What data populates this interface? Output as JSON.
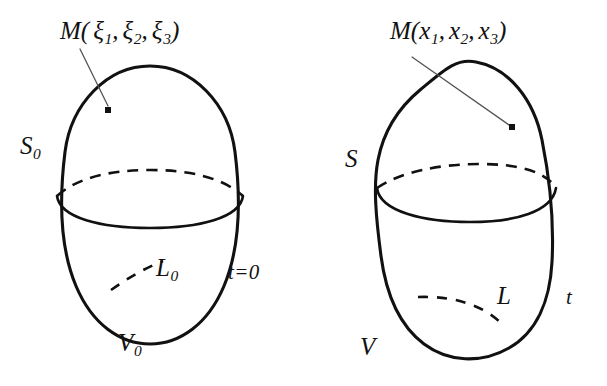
{
  "figure": {
    "background_color": "#ffffff",
    "ink_color": "#111111",
    "leader_color": "#555555",
    "width": 607,
    "height": 386
  },
  "panels": [
    {
      "id": "reference-configuration",
      "side": "left",
      "point_label": {
        "name": "M",
        "open_paren": "(",
        "coordinates": [
          "ξ",
          "ξ",
          "ξ"
        ],
        "subscripts": [
          "1",
          "2",
          "3"
        ],
        "separator": ",",
        "close_paren": ")",
        "full_text": "M(ξ₁, ξ₂, ξ₃)"
      },
      "surface_label": {
        "symbol": "S",
        "subscript": "0",
        "full_text": "S₀"
      },
      "curve_label": {
        "symbol": "L",
        "subscript": "0",
        "full_text": "L₀"
      },
      "volume_label": {
        "symbol": "V",
        "subscript": "0",
        "full_text": "V₀"
      },
      "time_label": {
        "symbol": "t",
        "relation": "=",
        "value": "0",
        "full_text": "t=0"
      }
    },
    {
      "id": "current-configuration",
      "side": "right",
      "point_label": {
        "name": "M",
        "open_paren": "(",
        "coordinates": [
          "x",
          "x",
          "x"
        ],
        "subscripts": [
          "1",
          "2",
          "3"
        ],
        "separator": ",",
        "close_paren": ")",
        "full_text": "M(x₁, x₂, x₃)"
      },
      "surface_label": {
        "symbol": "S",
        "subscript": "",
        "full_text": "S"
      },
      "curve_label": {
        "symbol": "L",
        "subscript": "",
        "full_text": "L"
      },
      "volume_label": {
        "symbol": "V",
        "subscript": "",
        "full_text": "V"
      },
      "time_label": {
        "symbol": "t",
        "relation": "",
        "value": "",
        "full_text": "t"
      }
    }
  ],
  "geometry": {
    "left_body_path": "M 150 66 C 193 66 229 104 235 152 C 241 200 240 248 224 286 C 208 324 180 344 150 344 C 120 344 92 324 76 286 C 60 248 59 200 65 152 C 71 104 107 66 150 66 Z",
    "left_equator_back": "M 57 196 C 78 177 112 170 150 170 C 188 170 222 177 243 196",
    "left_equator_front": "M 57 196 C 60 218 101 228 150 228 C 199 228 240 218 243 196",
    "left_interior_curve": "M 111 290 C 128 278 145 268 163 261",
    "left_leader": "M 80 49 L 108 106",
    "left_point": {
      "x": 108,
      "y": 110,
      "size": 6
    },
    "right_body_path": "M 476 62 C 509 68 534 100 542 140 C 550 180 554 224 552 262 C 550 300 537 332 509 348 C 481 364 448 362 424 344 C 400 326 386 294 381 256 C 376 218 373 186 378 160 C 383 134 396 110 420 90 C 444 70 456 58 476 62 Z",
    "right_equator_back": "M 377 188 C 400 172 440 164 480 164 C 520 164 546 172 556 188",
    "right_equator_front": "M 377 188 C 380 212 425 222 470 222 C 515 222 552 212 556 188",
    "right_interior_curve": "M 418 297 C 448 296 478 302 500 322",
    "right_leader": "M 412 57 L 512 127",
    "right_point": {
      "x": 512,
      "y": 127,
      "size": 6
    }
  },
  "label_positions": {
    "left_point_label": {
      "x": 60,
      "y": 18
    },
    "left_surface_label": {
      "x": 20,
      "y": 133
    },
    "left_curve_label": {
      "x": 156,
      "y": 255
    },
    "left_volume_label": {
      "x": 118,
      "y": 330
    },
    "left_time_label": {
      "x": 228,
      "y": 262
    },
    "right_point_label": {
      "x": 390,
      "y": 18
    },
    "right_surface_label": {
      "x": 345,
      "y": 146
    },
    "right_curve_label": {
      "x": 497,
      "y": 283
    },
    "right_volume_label": {
      "x": 360,
      "y": 334
    },
    "right_time_label": {
      "x": 566,
      "y": 287
    }
  }
}
